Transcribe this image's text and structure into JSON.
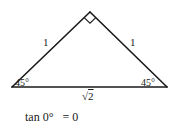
{
  "diagram": {
    "type": "right isosceles triangle",
    "vertices": {
      "apex": [
        90,
        12
      ],
      "left": [
        12,
        87
      ],
      "right": [
        167,
        87
      ]
    },
    "right_angle_marker": "square at apex",
    "line_color": "#1a1a1a",
    "labels": {
      "left_leg": "1",
      "right_leg": "1",
      "left_angle": "45°",
      "right_angle": "45°",
      "hypotenuse_symbol": "√",
      "hypotenuse_value": "2"
    }
  },
  "formula": {
    "lhs": "tan 0°",
    "rhs": "= 0"
  }
}
